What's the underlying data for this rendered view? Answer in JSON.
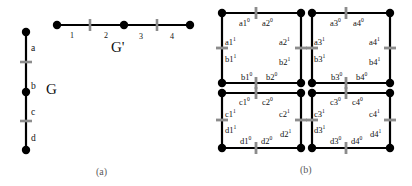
{
  "figure": {
    "panels": [
      {
        "id": "a",
        "caption": "(a)"
      },
      {
        "id": "b",
        "caption": "(b)"
      }
    ]
  },
  "panel_a": {
    "graph_G": {
      "name": "G",
      "orientation": "vertical",
      "edge_labels": [
        "a",
        "b",
        "c",
        "d"
      ],
      "nodes": 3,
      "subdivision_marks": 2
    },
    "graph_Gprime": {
      "name": "G'",
      "orientation": "horizontal",
      "edge_labels": [
        "1",
        "2",
        "3",
        "4"
      ],
      "nodes": 3,
      "subdivision_marks": 2
    }
  },
  "panel_b": {
    "squares": [
      {
        "id": "top-left",
        "labels": [
          "a1⁰",
          "a2⁰",
          "a1¹",
          "a2¹",
          "b1¹",
          "b2¹",
          "b1⁰",
          "b2⁰"
        ],
        "top_left": "a1",
        "top_right": "a2",
        "bottom_left": "b1",
        "bottom_right": "b2"
      },
      {
        "id": "top-right",
        "labels": [
          "a3⁰",
          "a4⁰",
          "a3¹",
          "a4¹",
          "b3¹",
          "b4¹",
          "b3⁰",
          "b4⁰"
        ],
        "top_left": "a3",
        "top_right": "a4",
        "bottom_left": "b3",
        "bottom_right": "b4"
      },
      {
        "id": "bottom-left",
        "labels": [
          "c1⁰",
          "c2⁰",
          "c1¹",
          "c2¹",
          "d1¹",
          "d2¹",
          "d1⁰",
          "d2⁰"
        ],
        "top_left": "c1",
        "top_right": "c2",
        "bottom_left": "d1",
        "bottom_right": "d2"
      },
      {
        "id": "bottom-right",
        "labels": [
          "c3⁰",
          "c4⁰",
          "c3¹",
          "c4¹",
          "d3¹",
          "d4¹",
          "d3⁰",
          "d4⁰"
        ],
        "top_left": "c3",
        "top_right": "c4",
        "bottom_left": "d3",
        "bottom_right": "d4"
      }
    ],
    "label_texts": {
      "a1_0": "a1",
      "a1_0_sup": "0",
      "a2_0": "a2",
      "a2_0_sup": "0",
      "a3_0": "a3",
      "a3_0_sup": "0",
      "a4_0": "a4",
      "a4_0_sup": "0",
      "a1_1": "a1",
      "a1_1_sup": "1",
      "a2_1": "a2",
      "a2_1_sup": "1",
      "a3_1": "a3",
      "a3_1_sup": "1",
      "a4_1": "a4",
      "a4_1_sup": "1",
      "b1_1": "b1",
      "b1_1_sup": "1",
      "b2_1": "b2",
      "b2_1_sup": "1",
      "b3_1": "b3",
      "b3_1_sup": "1",
      "b4_1": "b4",
      "b4_1_sup": "1",
      "b1_0": "b1",
      "b1_0_sup": "0",
      "b2_0": "b2",
      "b2_0_sup": "0",
      "b3_0": "b3",
      "b3_0_sup": "0",
      "b4_0": "b4",
      "b4_0_sup": "0",
      "c1_0": "c1",
      "c1_0_sup": "0",
      "c2_0": "c2",
      "c2_0_sup": "0",
      "c3_0": "c3",
      "c3_0_sup": "0",
      "c4_0": "c4",
      "c4_0_sup": "0",
      "c1_1": "c1",
      "c1_1_sup": "1",
      "c2_1": "c2",
      "c2_1_sup": "1",
      "c3_1": "c3",
      "c3_1_sup": "1",
      "c4_1": "c4",
      "c4_1_sup": "1",
      "d1_1": "d1",
      "d1_1_sup": "1",
      "d2_1": "d2",
      "d2_1_sup": "1",
      "d3_1": "d3",
      "d3_1_sup": "1",
      "d4_1": "d4",
      "d4_1_sup": "1",
      "d1_0": "d1",
      "d1_0_sup": "0",
      "d2_0": "d2",
      "d2_0_sup": "0",
      "d3_0": "d3",
      "d3_0_sup": "0",
      "d4_0": "d4",
      "d4_0_sup": "0"
    }
  },
  "colors": {
    "ink": "#111111",
    "edge": "#000000",
    "node": "#000000",
    "tick": "#8c8c8c",
    "caption": "#5a5a5a",
    "background": "#ffffff"
  }
}
